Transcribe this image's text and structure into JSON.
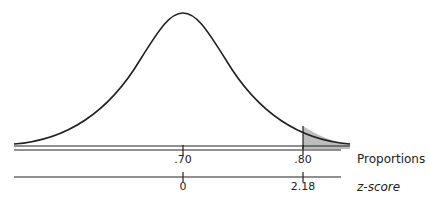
{
  "diagram": {
    "type": "normal-distribution",
    "shaded_region": "right tail beyond .80",
    "shade_color": "#bdbdbd",
    "line_color": "#222222",
    "axes": [
      {
        "name": "Proportions",
        "ticks": [
          ".70",
          ".80"
        ]
      },
      {
        "name": "z-score",
        "ticks": [
          "0",
          "2.18"
        ]
      }
    ]
  }
}
